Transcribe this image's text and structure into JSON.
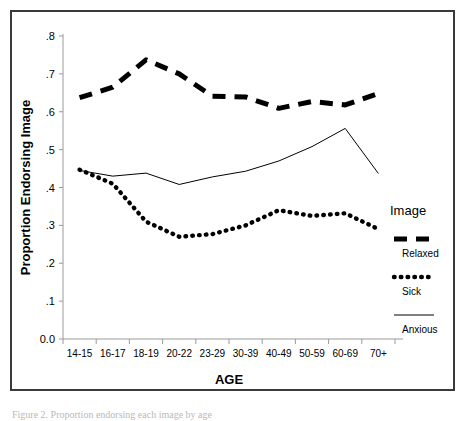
{
  "figure": {
    "caption": "Figure 2. Proportion endorsing each image by age"
  },
  "chart_data": {
    "type": "line",
    "title": "",
    "xlabel": "AGE",
    "ylabel": "Proportion Endorsing Image",
    "categories": [
      "14-15",
      "16-17",
      "18-19",
      "20-22",
      "23-29",
      "30-39",
      "40-49",
      "50-59",
      "60-69",
      "70+"
    ],
    "ylim": [
      0.0,
      0.8
    ],
    "ytick_labels": [
      "0.0",
      ".1",
      ".2",
      ".3",
      ".4",
      ".5",
      ".6",
      ".7",
      ".8"
    ],
    "ytick_values": [
      0.0,
      0.1,
      0.2,
      0.3,
      0.4,
      0.5,
      0.6,
      0.7,
      0.8
    ],
    "grid": false,
    "legend_position": "right",
    "legend_title": "Image",
    "series": [
      {
        "name": "Relaxed",
        "style": "thick-dashed",
        "values": [
          0.637,
          0.665,
          0.737,
          0.7,
          0.641,
          0.639,
          0.609,
          0.627,
          0.618,
          0.648
        ]
      },
      {
        "name": "Sick",
        "style": "dotted",
        "values": [
          0.447,
          0.41,
          0.31,
          0.27,
          0.277,
          0.3,
          0.34,
          0.325,
          0.332,
          0.29
        ]
      },
      {
        "name": "Anxious",
        "style": "thin-solid",
        "values": [
          0.445,
          0.43,
          0.438,
          0.408,
          0.428,
          0.443,
          0.47,
          0.508,
          0.556,
          0.437
        ]
      }
    ]
  }
}
